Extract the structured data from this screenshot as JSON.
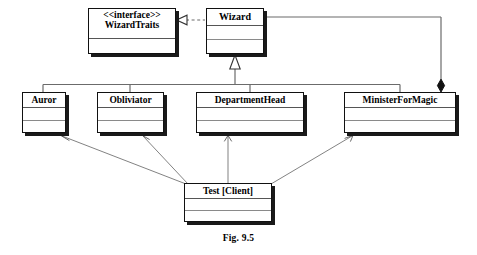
{
  "figure": {
    "caption": "Fig. 9.5",
    "diagram_type": "uml-class-diagram",
    "background_color": "#ffffff",
    "line_color": "#555555",
    "box_border_color": "#111111",
    "shadow_color": "#1a1a1a"
  },
  "classes": {
    "wizard_traits": {
      "stereotype": "<<interface>>",
      "name": "WizardTraits",
      "x": 88,
      "y": 8,
      "width": 88,
      "height": 46,
      "name_height": 30,
      "compartments": 1
    },
    "wizard": {
      "stereotype": "",
      "name": "Wizard",
      "x": 206,
      "y": 8,
      "width": 58,
      "height": 46,
      "name_height": 17,
      "compartments": 2
    },
    "auror": {
      "stereotype": "",
      "name": "Auror",
      "x": 22,
      "y": 92,
      "width": 44,
      "height": 41,
      "name_height": 15,
      "compartments": 2
    },
    "obliviator": {
      "stereotype": "",
      "name": "Obliviator",
      "x": 97,
      "y": 92,
      "width": 67,
      "height": 41,
      "name_height": 15,
      "compartments": 2
    },
    "department_head": {
      "stereotype": "",
      "name": "DepartmentHead",
      "x": 196,
      "y": 92,
      "width": 108,
      "height": 41,
      "name_height": 15,
      "compartments": 2
    },
    "minister_for_magic": {
      "stereotype": "",
      "name": "MinisterForMagic",
      "x": 344,
      "y": 92,
      "width": 112,
      "height": 41,
      "name_height": 15,
      "compartments": 2
    },
    "test_client": {
      "stereotype": "",
      "name": "Test [Client]",
      "x": 184,
      "y": 183,
      "width": 88,
      "height": 39,
      "name_height": 15,
      "compartments": 2
    }
  },
  "relationships": [
    {
      "id": "realization-wizard-wizardtraits",
      "type": "realization",
      "style": "dashed",
      "arrowhead": "hollow-triangle",
      "from": "wizard",
      "to": "wizard_traits"
    },
    {
      "id": "generalization-auror-wizard",
      "type": "generalization",
      "style": "solid",
      "arrowhead": "hollow-triangle",
      "from": "auror",
      "to": "wizard"
    },
    {
      "id": "generalization-obliviator-wizard",
      "type": "generalization",
      "style": "solid",
      "arrowhead": "hollow-triangle",
      "from": "obliviator",
      "to": "wizard"
    },
    {
      "id": "generalization-departmenthead-wizard",
      "type": "generalization",
      "style": "solid",
      "arrowhead": "hollow-triangle",
      "from": "department_head",
      "to": "wizard"
    },
    {
      "id": "generalization-ministerformagic-wizard",
      "type": "generalization",
      "style": "solid",
      "arrowhead": "hollow-triangle",
      "from": "minister_for_magic",
      "to": "wizard"
    },
    {
      "id": "composition-wizard-ministerformagic",
      "type": "composition",
      "style": "solid",
      "arrowhead": "filled-diamond",
      "from": "wizard",
      "to": "minister_for_magic"
    },
    {
      "id": "dependency-test-auror",
      "type": "dependency",
      "style": "solid",
      "arrowhead": "open-arrow",
      "from": "test_client",
      "to": "auror"
    },
    {
      "id": "dependency-test-obliviator",
      "type": "dependency",
      "style": "solid",
      "arrowhead": "open-arrow",
      "from": "test_client",
      "to": "obliviator"
    },
    {
      "id": "dependency-test-departmenthead",
      "type": "dependency",
      "style": "solid",
      "arrowhead": "open-arrow",
      "from": "test_client",
      "to": "department_head"
    },
    {
      "id": "dependency-test-ministerformagic",
      "type": "dependency",
      "style": "solid",
      "arrowhead": "open-arrow",
      "from": "test_client",
      "to": "minister_for_magic"
    }
  ]
}
